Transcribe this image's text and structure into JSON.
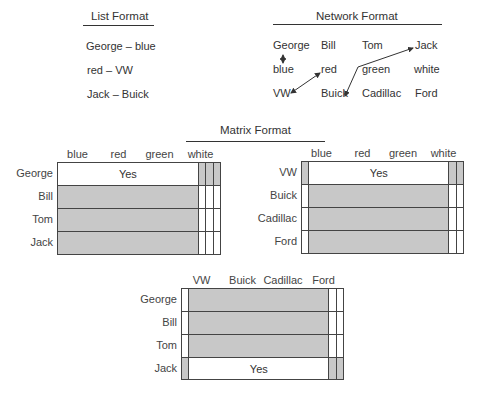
{
  "list_format": {
    "title": "List Format",
    "items": [
      "George – blue",
      "red – VW",
      "Jack – Buick"
    ]
  },
  "network_format": {
    "title": "Network Format",
    "rows": [
      [
        "George",
        "Bill",
        "Tom",
        "Jack"
      ],
      [
        "blue",
        "red",
        "green",
        "white"
      ],
      [
        "VW",
        "Buick",
        "Cadillac",
        "Ford"
      ]
    ],
    "links": [
      {
        "from": "George",
        "to": "blue",
        "type": "double-arrow"
      },
      {
        "from": "red",
        "to": "VW",
        "type": "double-arrow"
      },
      {
        "from": "Jack",
        "to": "Buick",
        "type": "double-arrow"
      }
    ]
  },
  "matrix_format": {
    "title": "Matrix Format",
    "tables": [
      {
        "name": "people-colors",
        "columns": [
          "blue",
          "red",
          "green",
          "white"
        ],
        "rows": [
          "George",
          "Bill",
          "Tom",
          "Jack"
        ],
        "cells": [
          [
            "Yes",
            "",
            "",
            ""
          ],
          [
            "",
            "",
            "",
            ""
          ],
          [
            "",
            "",
            "",
            ""
          ],
          [
            "",
            "",
            "",
            ""
          ]
        ],
        "shaded": [
          [
            false,
            true,
            true,
            true
          ],
          [
            true,
            false,
            false,
            false
          ],
          [
            true,
            false,
            false,
            false
          ],
          [
            true,
            false,
            false,
            false
          ]
        ]
      },
      {
        "name": "cars-colors",
        "columns": [
          "blue",
          "red",
          "green",
          "white"
        ],
        "rows": [
          "VW",
          "Buick",
          "Cadillac",
          "Ford"
        ],
        "cells": [
          [
            "",
            "Yes",
            "",
            ""
          ],
          [
            "",
            "",
            "",
            ""
          ],
          [
            "",
            "",
            "",
            ""
          ],
          [
            "",
            "",
            "",
            ""
          ]
        ],
        "shaded": [
          [
            true,
            false,
            true,
            true
          ],
          [
            false,
            true,
            false,
            false
          ],
          [
            false,
            true,
            false,
            false
          ],
          [
            false,
            true,
            false,
            false
          ]
        ]
      },
      {
        "name": "people-cars",
        "columns": [
          "VW",
          "Buick",
          "Cadillac",
          "Ford"
        ],
        "rows": [
          "George",
          "Bill",
          "Tom",
          "Jack"
        ],
        "cells": [
          [
            "",
            "",
            "",
            ""
          ],
          [
            "",
            "",
            "",
            ""
          ],
          [
            "",
            "",
            "",
            ""
          ],
          [
            "",
            "Yes",
            "",
            ""
          ]
        ],
        "shaded": [
          [
            false,
            true,
            false,
            false
          ],
          [
            false,
            true,
            false,
            false
          ],
          [
            false,
            true,
            false,
            false
          ],
          [
            true,
            false,
            true,
            true
          ]
        ]
      }
    ]
  }
}
